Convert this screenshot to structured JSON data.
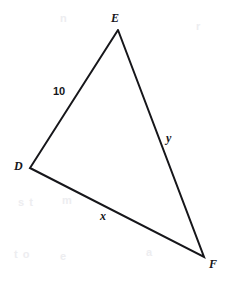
{
  "figure": {
    "kind": "geometry-triangle-diagram",
    "canvas": {
      "width": 227,
      "height": 283
    },
    "background_color": "#ffffff",
    "stroke_color": "#16161a",
    "stroke_width": 2,
    "label_color": "#16161a"
  },
  "vertices": [
    {
      "id": "E",
      "label": "E",
      "x": 118,
      "y": 30,
      "label_x": 111,
      "label_y": 12,
      "style": "bold-italic"
    },
    {
      "id": "D",
      "label": "D",
      "x": 30,
      "y": 168,
      "label_x": 14,
      "label_y": 160,
      "style": "bold-italic"
    },
    {
      "id": "F",
      "label": "F",
      "x": 204,
      "y": 257,
      "label_x": 209,
      "label_y": 258,
      "style": "bold-italic"
    }
  ],
  "sides": [
    {
      "id": "DE",
      "from": "D",
      "to": "E",
      "label": "10",
      "label_x": 53,
      "label_y": 86,
      "style": "bold-upright"
    },
    {
      "id": "EF",
      "from": "E",
      "to": "F",
      "label": "y",
      "label_x": 166,
      "label_y": 132,
      "style": "bold-italic"
    },
    {
      "id": "DF",
      "from": "D",
      "to": "F",
      "label": "x",
      "label_x": 100,
      "label_y": 210,
      "style": "bold-italic"
    }
  ],
  "background_artifacts": [
    {
      "text": "s t",
      "x": 18,
      "y": 196
    },
    {
      "text": "m",
      "x": 62,
      "y": 194
    },
    {
      "text": "t o",
      "x": 14,
      "y": 248
    },
    {
      "text": "e",
      "x": 60,
      "y": 250
    },
    {
      "text": "a",
      "x": 146,
      "y": 246
    },
    {
      "text": "r",
      "x": 196,
      "y": 20
    },
    {
      "text": "n",
      "x": 60,
      "y": 12
    }
  ],
  "polyline_points": "118,30 30,168 204,257 118,30"
}
